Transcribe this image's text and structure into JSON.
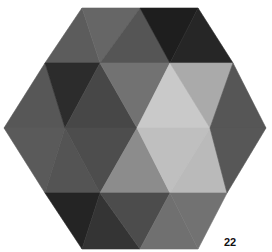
{
  "figure": {
    "page_label": "22",
    "vertices": {
      "A0": [
        82,
        8
      ],
      "A1": [
        140,
        8
      ],
      "A2": [
        198,
        8
      ],
      "B0": [
        45,
        63
      ],
      "B1": [
        100,
        63
      ],
      "B2": [
        170,
        63
      ],
      "B3": [
        233,
        63
      ],
      "C0": [
        4,
        128
      ],
      "C1": [
        65,
        128
      ],
      "C2": [
        137,
        128
      ],
      "C3": [
        210,
        128
      ],
      "C4": [
        266,
        128
      ],
      "D0": [
        45,
        193
      ],
      "D1": [
        100,
        193
      ],
      "D2": [
        170,
        193
      ],
      "D3": [
        227,
        193
      ],
      "E0": [
        82,
        249
      ],
      "E1": [
        140,
        249
      ],
      "E2": [
        198,
        249
      ]
    },
    "triangles": [
      {
        "pts": [
          "B0",
          "A0",
          "B1"
        ],
        "fill": "#5c5c5c"
      },
      {
        "pts": [
          "A0",
          "A1",
          "B1"
        ],
        "fill": "#666666"
      },
      {
        "pts": [
          "B1",
          "A1",
          "B2"
        ],
        "fill": "#555555"
      },
      {
        "pts": [
          "A1",
          "A2",
          "B2"
        ],
        "fill": "#1e1e1e"
      },
      {
        "pts": [
          "B2",
          "A2",
          "B3"
        ],
        "fill": "#262626"
      },
      {
        "pts": [
          "C0",
          "B0",
          "C1"
        ],
        "fill": "#575757"
      },
      {
        "pts": [
          "B0",
          "B1",
          "C1"
        ],
        "fill": "#2c2c2c"
      },
      {
        "pts": [
          "C1",
          "B1",
          "C2"
        ],
        "fill": "#474747"
      },
      {
        "pts": [
          "B1",
          "B2",
          "C2"
        ],
        "fill": "#727272"
      },
      {
        "pts": [
          "C2",
          "B2",
          "C3"
        ],
        "fill": "#c9c9c9"
      },
      {
        "pts": [
          "B2",
          "B3",
          "C3"
        ],
        "fill": "#aaaaaa"
      },
      {
        "pts": [
          "C3",
          "B3",
          "C4"
        ],
        "fill": "#565656"
      },
      {
        "pts": [
          "C0",
          "C1",
          "D0"
        ],
        "fill": "#5a5a5a"
      },
      {
        "pts": [
          "D0",
          "C1",
          "D1"
        ],
        "fill": "#545454"
      },
      {
        "pts": [
          "C1",
          "C2",
          "D1"
        ],
        "fill": "#4d4d4d"
      },
      {
        "pts": [
          "D1",
          "C2",
          "D2"
        ],
        "fill": "#8c8c8c"
      },
      {
        "pts": [
          "C2",
          "C3",
          "D2"
        ],
        "fill": "#bfbfbf"
      },
      {
        "pts": [
          "D2",
          "C3",
          "D3"
        ],
        "fill": "#bababa"
      },
      {
        "pts": [
          "C3",
          "C4",
          "D3"
        ],
        "fill": "#575757"
      },
      {
        "pts": [
          "D0",
          "D1",
          "E0"
        ],
        "fill": "#242424"
      },
      {
        "pts": [
          "E0",
          "D1",
          "E1"
        ],
        "fill": "#343434"
      },
      {
        "pts": [
          "D1",
          "D2",
          "E1"
        ],
        "fill": "#4c4c4c"
      },
      {
        "pts": [
          "E1",
          "D2",
          "E2"
        ],
        "fill": "#707070"
      },
      {
        "pts": [
          "D2",
          "D3",
          "E2"
        ],
        "fill": "#727272"
      }
    ]
  }
}
